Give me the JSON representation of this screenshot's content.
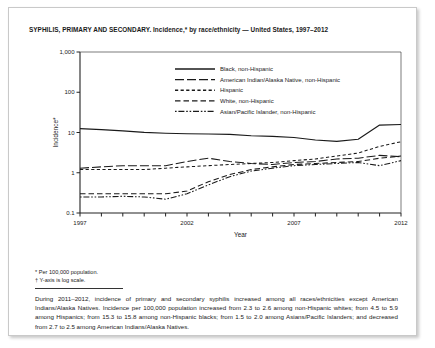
{
  "page": {
    "title": "SYPHILIS, PRIMARY AND SECONDARY. Incidence,* by race/ethnicity — United States, 1997–2012",
    "footnote_1": "* Per 100,000 population.",
    "footnote_2": "† Y-axis is log scale.",
    "body_text": "During 2011–2012, incidence of primary and secondary syphilis increased among all races/ethnicities except American Indians/Alaska Natives. Incidence per 100,000 population increased from 2.3 to 2.6 among non-Hispanic whites; from 4.5 to 5.9 among Hispanics; from 15.3 to 15.8 among non-Hispanic blacks; from 1.5 to 2.0 among Asians/Pacific Islanders; and decreased from 2.7 to 2.5 among American Indians/Alaska Natives."
  },
  "chart_data": {
    "type": "line",
    "title": "SYPHILIS, PRIMARY AND SECONDARY. Incidence,* by race/ethnicity — United States, 1997–2012",
    "xlabel": "Year",
    "ylabel": "Incidence*",
    "yscale": "log",
    "ylim": [
      0.1,
      1000
    ],
    "ytick_labels": [
      "1,000",
      "100",
      "10",
      "1",
      "0.1"
    ],
    "ytick_values": [
      1000,
      100,
      10,
      1,
      0.1
    ],
    "xlim": [
      1997,
      2012
    ],
    "xtick_labels": [
      "1997",
      "2002",
      "2007",
      "2012"
    ],
    "xtick_values": [
      1997,
      2002,
      2007,
      2012
    ],
    "x": [
      1997,
      1998,
      1999,
      2000,
      2001,
      2002,
      2003,
      2004,
      2005,
      2006,
      2007,
      2008,
      2009,
      2010,
      2011,
      2012
    ],
    "grid": false,
    "legend_position": "upper-center-inside",
    "series": [
      {
        "name": "Black, non-Hispanic",
        "style": "solid",
        "values": [
          12.5,
          11.8,
          11.0,
          10.1,
          9.6,
          9.3,
          9.2,
          9.0,
          8.3,
          8.0,
          7.5,
          6.5,
          6.0,
          6.8,
          15.3,
          15.8
        ]
      },
      {
        "name": "American Indian/Alaska Native, non-Hispanic",
        "style": "long-dash",
        "values": [
          1.3,
          1.4,
          1.5,
          1.5,
          1.5,
          1.9,
          2.3,
          1.9,
          1.7,
          1.6,
          1.8,
          1.9,
          2.2,
          2.3,
          2.7,
          2.5
        ]
      },
      {
        "name": "Hispanic",
        "style": "short-dash",
        "values": [
          1.2,
          1.2,
          1.2,
          1.2,
          1.3,
          1.4,
          1.5,
          1.6,
          1.7,
          1.8,
          2.0,
          2.2,
          2.6,
          3.1,
          4.5,
          5.9
        ]
      },
      {
        "name": "White, non-Hispanic",
        "style": "medium-dash",
        "values": [
          0.3,
          0.3,
          0.3,
          0.3,
          0.3,
          0.35,
          0.6,
          0.9,
          1.2,
          1.4,
          1.6,
          1.7,
          1.8,
          1.9,
          2.3,
          2.6
        ]
      },
      {
        "name": "Asian/Pacific Islander, non-Hispanic",
        "style": "dash-dot",
        "values": [
          0.25,
          0.25,
          0.26,
          0.25,
          0.22,
          0.3,
          0.5,
          0.8,
          1.1,
          1.3,
          1.5,
          1.6,
          1.7,
          1.8,
          1.5,
          2.0
        ]
      }
    ]
  }
}
